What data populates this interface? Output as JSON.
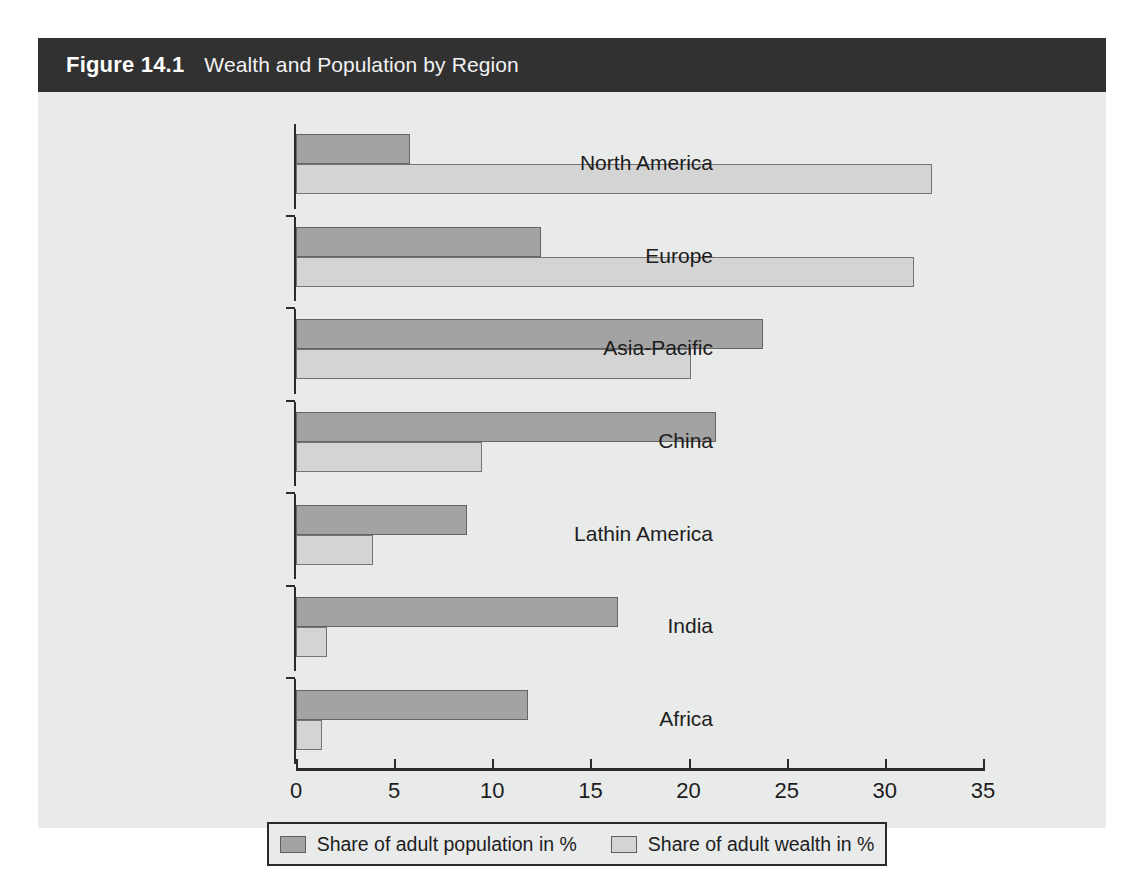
{
  "figure": {
    "number": "Figure 14.1",
    "title": "Wealth and Population by Region"
  },
  "colors": {
    "title_bar_bg": "#313131",
    "panel_bg": "#e9eaea",
    "population_fill": "#a3a3a3",
    "wealth_fill": "#d4d4d4",
    "axis": "#2b2b2b",
    "text": "#1d1d1d"
  },
  "chart_data": {
    "type": "bar",
    "orientation": "horizontal",
    "title": "Wealth and Population by Region",
    "xlabel": "",
    "ylabel": "",
    "xlim": [
      0,
      35
    ],
    "xticks": [
      0,
      5,
      10,
      15,
      20,
      25,
      30,
      35
    ],
    "xtick_labels": [
      "0",
      "5",
      "10",
      "15",
      "20",
      "25",
      "30",
      "35"
    ],
    "grid": false,
    "legend_position": "bottom",
    "categories": [
      "North America",
      "Europe",
      "Asia-Pacific",
      "China",
      "Lathin America",
      "India",
      "Africa"
    ],
    "series": [
      {
        "name": "Share of adult population in %",
        "color": "#a3a3a3",
        "values": [
          5.8,
          12.5,
          23.8,
          21.4,
          8.7,
          16.4,
          11.8
        ]
      },
      {
        "name": "Share of adult wealth in %",
        "color": "#d4d4d4",
        "values": [
          32.4,
          31.5,
          20.1,
          9.5,
          3.9,
          1.6,
          1.3
        ]
      }
    ]
  },
  "legend": {
    "entries": [
      {
        "label": "Share of adult population in %",
        "swatch": "population"
      },
      {
        "label": "Share of adult wealth in %",
        "swatch": "wealth"
      }
    ]
  }
}
